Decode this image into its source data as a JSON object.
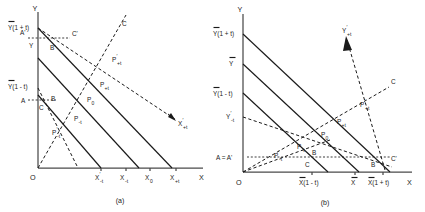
{
  "figure": {
    "panels": [
      {
        "id": "a",
        "caption": "(a)",
        "axis": {
          "y_label": "Y",
          "x_label": "X",
          "origin_label": "O"
        },
        "y_axis_ticks": [
          {
            "key": "y_hi",
            "text": "Y(1 + t)",
            "overbar": true
          },
          {
            "key": "a_prime",
            "text": "A'",
            "overbar": false
          },
          {
            "key": "y_mid",
            "text": "Y",
            "overbar": false
          },
          {
            "key": "y_lo",
            "text": "Y(1 - t)",
            "overbar": true
          },
          {
            "key": "a",
            "text": "A",
            "overbar": false
          }
        ],
        "x_axis_ticks": [
          {
            "key": "xm_prime",
            "text": "X",
            "sub": "-t",
            "prime": true
          },
          {
            "key": "xm",
            "text": "X",
            "sub": "-t",
            "prime": false
          },
          {
            "key": "x0",
            "text": "X",
            "sub": "0",
            "prime": false
          },
          {
            "key": "xp",
            "text": "X",
            "sub": "+t",
            "prime": false
          }
        ],
        "point_labels": [
          {
            "key": "p_plus_prime",
            "text": "P",
            "sub": "+t",
            "prime": true
          },
          {
            "key": "p_plus",
            "text": "P",
            "sub": "+t",
            "prime": false
          },
          {
            "key": "p_zero",
            "text": "P",
            "sub": "0",
            "prime": false
          },
          {
            "key": "p_minus",
            "text": "P",
            "sub": "-t",
            "prime": false
          },
          {
            "key": "p_minus_prime",
            "text": "P",
            "sub": "-t",
            "prime": true
          }
        ],
        "curve_labels": [
          {
            "key": "c_upper_prime",
            "text": "C'"
          },
          {
            "key": "c_upper",
            "text": "C"
          },
          {
            "key": "b_prime",
            "text": "B'"
          },
          {
            "key": "b_lower",
            "text": "B"
          },
          {
            "key": "c_lower",
            "text": "C"
          },
          {
            "key": "x_plus_prime_ray",
            "text": "X",
            "sub": "+t",
            "prime": true
          }
        ]
      },
      {
        "id": "b",
        "caption": "(b)",
        "axis": {
          "y_label": "Y",
          "x_label": "X",
          "origin_label": "O"
        },
        "y_axis_ticks": [
          {
            "key": "y_hi",
            "text": "Y(1 + t)",
            "overbar": true
          },
          {
            "key": "y_bar",
            "text": "Y",
            "overbar": true
          },
          {
            "key": "y_lo",
            "text": "Y(1 - t)",
            "overbar": true
          },
          {
            "key": "y_minus_prime",
            "text": "Y",
            "sub": "-t",
            "prime": true
          },
          {
            "key": "a_equals_aprime",
            "text": "A = A'",
            "overbar": false
          }
        ],
        "x_axis_ticks": [
          {
            "key": "x_lo",
            "text": "X(1 - t)",
            "overbar": true
          },
          {
            "key": "x_bar",
            "text": "X",
            "overbar": true
          },
          {
            "key": "x_hi",
            "text": "X(1 + t)",
            "overbar": true
          }
        ],
        "point_labels": [
          {
            "key": "p_plus_prime",
            "text": "P",
            "sub": "+t",
            "prime": true
          },
          {
            "key": "p_plus",
            "text": "P",
            "sub": "+t",
            "prime": false
          },
          {
            "key": "p_zero",
            "text": "P",
            "sub": "0",
            "prime": false
          },
          {
            "key": "p_minus",
            "text": "P",
            "sub": "-t",
            "prime": false
          },
          {
            "key": "p_minus_prime",
            "text": "P",
            "sub": "-t",
            "prime": true
          }
        ],
        "curve_labels": [
          {
            "key": "y_plus_prime_ray",
            "text": "Y",
            "sub": "+t",
            "prime": true
          },
          {
            "key": "c_right",
            "text": "C"
          },
          {
            "key": "b_mid",
            "text": "B"
          },
          {
            "key": "c_mid",
            "text": "C"
          },
          {
            "key": "b_right",
            "text": "B"
          },
          {
            "key": "c_right_prime",
            "text": "C'"
          }
        ]
      }
    ],
    "colors": {
      "ink": "#1a1a1a",
      "axis": "#4a4a4a",
      "background": "#ffffff"
    }
  }
}
